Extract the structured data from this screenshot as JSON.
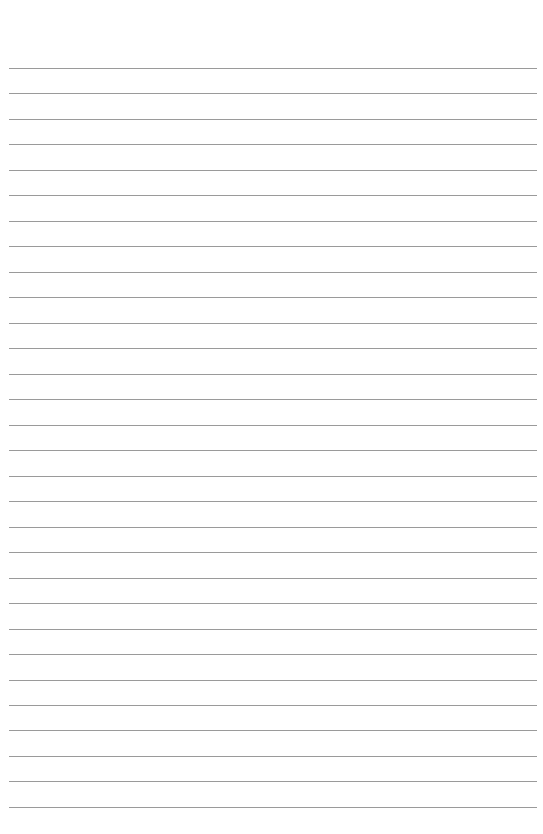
{
  "page": {
    "type": "lined-paper",
    "line_count": 30,
    "first_line_y": 68,
    "line_spacing": 25.48,
    "line_color": "#9a9a9a",
    "background_color": "#ffffff"
  }
}
